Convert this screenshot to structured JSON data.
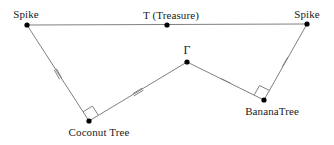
{
  "diagram": {
    "canvas": {
      "width": 334,
      "height": 145
    },
    "style": {
      "line_color": "#808080",
      "vertex_color": "#000000",
      "tick_color": "#808080",
      "right_angle_color": "#808080",
      "text_color": "#1a1a1a",
      "background": "#ffffff",
      "line_width": 1,
      "vertex_radius": 2.6
    },
    "points": {
      "spike_left": {
        "label": "Spike",
        "x": 27,
        "y": 25
      },
      "treasure": {
        "label": "T (Treasure)",
        "x": 167,
        "y": 25
      },
      "spike_right": {
        "label": "Spike",
        "x": 307,
        "y": 24
      },
      "coconut_tree": {
        "label": "Coconut Tree",
        "x": 89,
        "y": 121
      },
      "gamma": {
        "label": "Γ",
        "x": 187,
        "y": 62
      },
      "banana_tree": {
        "label": "BananaTree",
        "x": 264,
        "y": 100
      }
    },
    "labels": [
      {
        "name": "label-spike-left",
        "text": "Spike",
        "x": 26,
        "y": 8,
        "anchor": "middle"
      },
      {
        "name": "label-treasure",
        "text": "T (Treasure)",
        "x": 171,
        "y": 9,
        "anchor": "middle"
      },
      {
        "name": "label-spike-right",
        "text": "Spike",
        "x": 307,
        "y": 8,
        "anchor": "middle"
      },
      {
        "name": "label-gamma",
        "text": "Γ",
        "x": 187,
        "y": 44,
        "anchor": "middle"
      },
      {
        "name": "label-coconut-tree",
        "text": "Coconut Tree",
        "x": 99,
        "y": 126,
        "anchor": "middle"
      },
      {
        "name": "label-banana-tree",
        "text": "BananaTree",
        "x": 272,
        "y": 105,
        "anchor": "middle"
      }
    ],
    "segments": [
      {
        "name": "segment-spike-left-to-spike-right",
        "from": "spike_left",
        "to": "spike_right",
        "ticks": 0
      },
      {
        "name": "segment-spike-left-to-coconut",
        "from": "spike_left",
        "to": "coconut_tree",
        "ticks": 2
      },
      {
        "name": "segment-coconut-to-gamma",
        "from": "coconut_tree",
        "to": "gamma",
        "ticks": 2
      },
      {
        "name": "segment-gamma-to-banana",
        "from": "gamma",
        "to": "banana_tree",
        "ticks": 1
      },
      {
        "name": "segment-banana-to-spike-right",
        "from": "banana_tree",
        "to": "spike_right",
        "ticks": 1
      }
    ],
    "tick_marks": [
      {
        "name": "tick-mark-double-spike-coconut",
        "x": 58,
        "y": 74,
        "count": 2,
        "angle_deg": 60.5,
        "length": 11
      },
      {
        "name": "tick-mark-double-coconut-gamma",
        "x": 138,
        "y": 92,
        "count": 2,
        "angle_deg": -31.0,
        "length": 11
      },
      {
        "name": "tick-mark-single-gamma-banana",
        "x": 226,
        "y": 81,
        "count": 1,
        "angle_deg": 26.5,
        "length": 11
      },
      {
        "name": "tick-mark-single-banana-spike",
        "x": 285,
        "y": 62,
        "count": 1,
        "angle_deg": -60.5,
        "length": 11
      }
    ],
    "right_angles": [
      {
        "name": "right-angle-coconut-tree",
        "vertex": "coconut_tree",
        "arm_a": "spike_left",
        "arm_b": "gamma",
        "size": 11
      },
      {
        "name": "right-angle-banana-tree",
        "vertex": "banana_tree",
        "arm_a": "gamma",
        "arm_b": "spike_right",
        "size": 11
      }
    ]
  }
}
